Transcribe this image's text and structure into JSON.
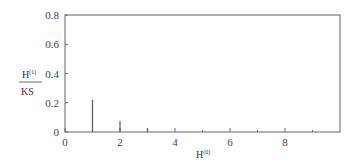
{
  "chart_data": {
    "type": "bar",
    "title": "",
    "xlabel": "H^(0)",
    "ylabel": "H^(1) / KS",
    "x": [
      1,
      2,
      3
    ],
    "values": [
      0.22,
      0.075,
      0.027
    ],
    "xlim": [
      0,
      10
    ],
    "ylim": [
      0,
      0.8
    ],
    "xticks": [
      0,
      2,
      4,
      6,
      8
    ],
    "yticks": [
      0,
      0.2,
      0.4,
      0.6,
      0.8
    ],
    "grid": false,
    "legend": null
  },
  "labels": {
    "x_main": "H",
    "x_sup": "(0)",
    "y_num_main": "H",
    "y_num_sup": "(1)",
    "y_den": "KS"
  },
  "ticks": {
    "x": [
      "0",
      "2",
      "4",
      "6",
      "8"
    ],
    "y": [
      "0",
      "0.2",
      "0.4",
      "0.6",
      "0.8"
    ]
  }
}
